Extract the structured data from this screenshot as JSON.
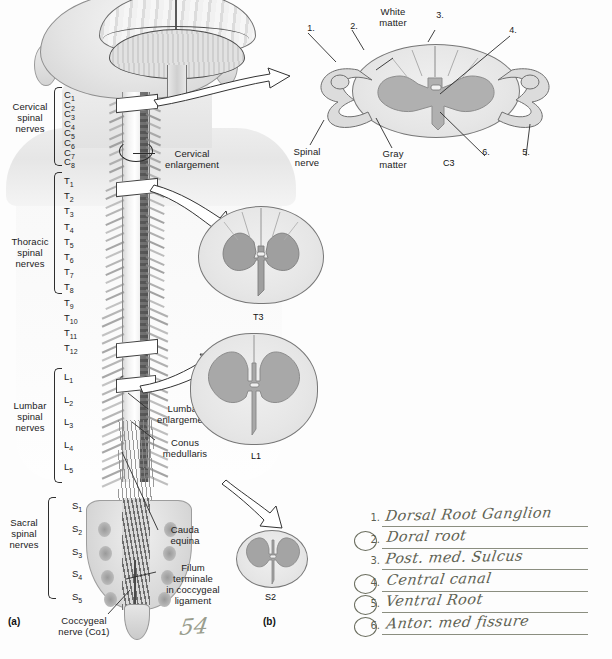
{
  "figure": {
    "panel_a_label": "(a)",
    "panel_b_label": "(b)"
  },
  "nerve_groups": [
    {
      "name": "cervical",
      "label": "Cervical\nspinal\nnerves"
    },
    {
      "name": "thoracic",
      "label": "Thoracic\nspinal\nnerves"
    },
    {
      "name": "lumbar",
      "label": "Lumbar\nspinal\nnerves"
    },
    {
      "name": "sacral",
      "label": "Sacral\nspinal\nnerves"
    }
  ],
  "vertebra_labels": {
    "cervical": [
      "C1",
      "C2",
      "C3",
      "C4",
      "C5",
      "C6",
      "C7",
      "C8"
    ],
    "thoracic": [
      "T1",
      "T2",
      "T3",
      "T4",
      "T5",
      "T6",
      "T7",
      "T8",
      "T9",
      "T10",
      "T11",
      "T12"
    ],
    "lumbar": [
      "L1",
      "L2",
      "L3",
      "L4",
      "L5"
    ],
    "sacral": [
      "S1",
      "S2",
      "S3",
      "S4",
      "S5"
    ]
  },
  "callouts": [
    {
      "name": "cervical-enlargement",
      "label": "Cervical\nenlargement"
    },
    {
      "name": "lumbar-enlargement",
      "label": "Lumbar\nenlargement"
    },
    {
      "name": "conus-medullaris",
      "label": "Conus\nmedullaris"
    },
    {
      "name": "cauda-equina",
      "label": "Cauda\nequina"
    },
    {
      "name": "filum-terminale",
      "label": "Filum\nterminale\nin coccygeal\nligament"
    },
    {
      "name": "coccygeal-nerve",
      "label": "Coccygeal\nnerve (Co1)"
    }
  ],
  "cross_sections": [
    {
      "name": "c3",
      "label": "C3"
    },
    {
      "name": "t3",
      "label": "T3"
    },
    {
      "name": "l1",
      "label": "L1"
    },
    {
      "name": "s2",
      "label": "S2"
    }
  ],
  "c3_annotations": {
    "white_matter": "White\nmatter",
    "gray_matter": "Gray\nmatter",
    "spinal_nerve": "Spinal\nnerve",
    "numbers": [
      "1.",
      "2.",
      "3.",
      "4.",
      "5.",
      "6."
    ]
  },
  "legend": {
    "title": "",
    "items": [
      {
        "num": "1.",
        "circled": false,
        "text": "Dorsal Root Ganglion"
      },
      {
        "num": "2.",
        "circled": true,
        "text": "Doral root"
      },
      {
        "num": "3.",
        "circled": false,
        "text": "Post. med. Sulcus"
      },
      {
        "num": "4.",
        "circled": true,
        "text": "Central canal"
      },
      {
        "num": "5.",
        "circled": true,
        "text": "Ventral Root"
      },
      {
        "num": "6.",
        "circled": true,
        "text": "Antor. med fissure"
      }
    ]
  },
  "marginalia": [
    {
      "name": "page-number-scribble",
      "text": "54"
    }
  ],
  "colors": {
    "paper": "#fdfdfd",
    "ink": "#1b1b1b",
    "pencil": "#5f6253",
    "gray_matter": "#b0b0b0",
    "white_matter": "#e6e6e6"
  }
}
